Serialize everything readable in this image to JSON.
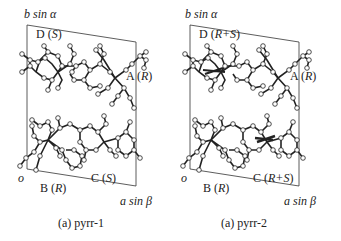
{
  "figure": {
    "panels": [
      {
        "id": "pyrr-1",
        "caption": "(a) pyrr-1",
        "axes": {
          "vertical": "b sin α",
          "horizontal": "a sin β",
          "origin": "o"
        },
        "molecule_labels": {
          "A": {
            "letter": "A",
            "config": "R"
          },
          "B": {
            "letter": "B",
            "config": "R"
          },
          "C": {
            "letter": "C",
            "config": "S"
          },
          "D": {
            "letter": "D",
            "config": "S"
          }
        }
      },
      {
        "id": "pyrr-2",
        "caption": "(a) pyrr-2",
        "axes": {
          "vertical": "b sin α",
          "horizontal": "a sin β",
          "origin": "o"
        },
        "molecule_labels": {
          "A": {
            "letter": "A",
            "config": "R"
          },
          "B": {
            "letter": "B",
            "config": "R"
          },
          "C": {
            "letter": "C",
            "config": "R+S"
          },
          "D": {
            "letter": "D",
            "config": "R+S"
          }
        }
      }
    ],
    "colors": {
      "line": "#222222",
      "atom_fill": "#ffffff",
      "background": "#ffffff"
    }
  }
}
